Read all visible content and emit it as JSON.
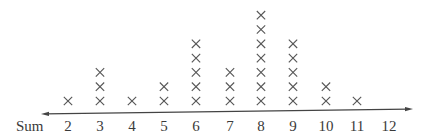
{
  "chart_data": {
    "type": "dot",
    "title": "",
    "xlabel": "Sum",
    "ylabel": "",
    "categories": [
      "2",
      "3",
      "4",
      "5",
      "6",
      "7",
      "8",
      "9",
      "10",
      "11",
      "12"
    ],
    "values": [
      1,
      3,
      1,
      2,
      5,
      3,
      7,
      5,
      2,
      1,
      0
    ],
    "marker": "x",
    "axis": {
      "arrows": "both",
      "grid": false
    }
  },
  "axis_label": "Sum",
  "colors": {
    "marker": "#555555",
    "axis": "#444444",
    "text": "#3a3a3a"
  }
}
